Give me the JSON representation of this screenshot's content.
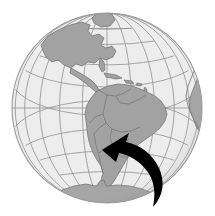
{
  "figure": {
    "title": "Globe centered on South America with rotation arrow",
    "type": "globe-illustration",
    "width": 215,
    "height": 216,
    "background_color": "#ffffff"
  },
  "globe": {
    "name": "orthographic-globe",
    "center_x": 107,
    "center_y": 108,
    "radius": 95,
    "projection": "orthographic",
    "center_longitude": -60,
    "center_latitude": 0,
    "ocean_color": "#ededed",
    "land_color": "#a2a2a2",
    "land_edge_color": "#6e6e6e",
    "graticule_color": "#8c8c8c",
    "outline_color": "#9a9a9a",
    "limb_shade_color": "#9e9e9e",
    "graticule_spacing_degrees": 15
  },
  "landmasses": [
    {
      "name": "south-america",
      "label": "South America",
      "visible": true
    },
    {
      "name": "north-america",
      "label": "North America",
      "visible": true
    },
    {
      "name": "central-america",
      "label": "Central America",
      "visible": true
    },
    {
      "name": "caribbean-islands",
      "label": "Caribbean Islands",
      "visible": true
    },
    {
      "name": "west-africa",
      "label": "Africa (west coast)",
      "visible": true
    },
    {
      "name": "antarctica",
      "label": "Antarctica",
      "visible": true
    },
    {
      "name": "greenland",
      "label": "Greenland",
      "visible": true
    }
  ],
  "arrow": {
    "name": "rotation-arrow",
    "color": "#000000",
    "direction": "counter-clockwise-up-left",
    "head_tip_x": 102,
    "head_tip_y": 150,
    "tail_tip_x": 153,
    "tail_tip_y": 207,
    "description": "Curved black arrow sweeping from lower right up and to the left"
  },
  "colors": {
    "background": "#ffffff",
    "ocean": "#ededed",
    "land": "#a2a2a2",
    "border": "#6e6e6e",
    "graticule": "#8c8c8c",
    "arrow": "#000000"
  }
}
